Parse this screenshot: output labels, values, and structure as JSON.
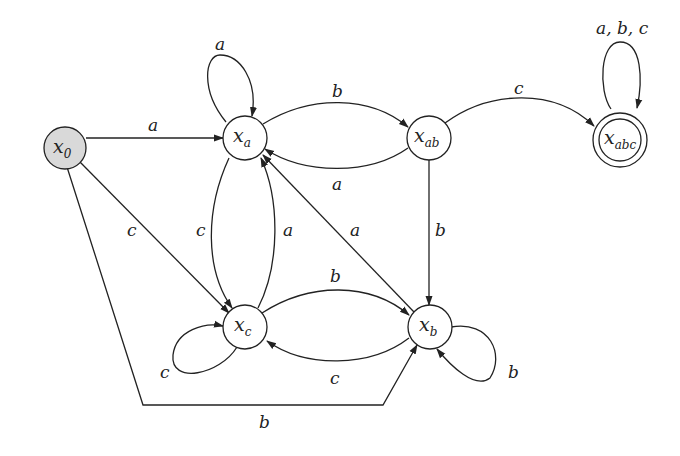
{
  "diagram": {
    "type": "finite-state-automaton",
    "states": [
      {
        "id": "x0",
        "label": "x",
        "sub": "0",
        "initial": true,
        "accepting": false
      },
      {
        "id": "xa",
        "label": "x",
        "sub": "a",
        "initial": false,
        "accepting": false
      },
      {
        "id": "xab",
        "label": "x",
        "sub": "ab",
        "initial": false,
        "accepting": false
      },
      {
        "id": "xabc",
        "label": "x",
        "sub": "abc",
        "initial": false,
        "accepting": true
      },
      {
        "id": "xc",
        "label": "x",
        "sub": "c",
        "initial": false,
        "accepting": false
      },
      {
        "id": "xb",
        "label": "x",
        "sub": "b",
        "initial": false,
        "accepting": false
      }
    ],
    "transitions": [
      {
        "from": "x0",
        "to": "xa",
        "label": "a"
      },
      {
        "from": "x0",
        "to": "xc",
        "label": "c"
      },
      {
        "from": "x0",
        "to": "xb",
        "label": "b"
      },
      {
        "from": "xa",
        "to": "xa",
        "label": "a"
      },
      {
        "from": "xa",
        "to": "xab",
        "label": "b"
      },
      {
        "from": "xa",
        "to": "xc",
        "label": "c"
      },
      {
        "from": "xab",
        "to": "xa",
        "label": "a"
      },
      {
        "from": "xab",
        "to": "xabc",
        "label": "c"
      },
      {
        "from": "xab",
        "to": "xb",
        "label": "b"
      },
      {
        "from": "xabc",
        "to": "xabc",
        "label": "a, b, c"
      },
      {
        "from": "xc",
        "to": "xa",
        "label": "a"
      },
      {
        "from": "xc",
        "to": "xc",
        "label": "c"
      },
      {
        "from": "xc",
        "to": "xb",
        "label": "b"
      },
      {
        "from": "xb",
        "to": "xa",
        "label": "a"
      },
      {
        "from": "xb",
        "to": "xc",
        "label": "c"
      },
      {
        "from": "xb",
        "to": "xb",
        "label": "b"
      }
    ]
  },
  "colors": {
    "stroke": "#222222",
    "initial_fill": "#d9d9d9",
    "background": "#ffffff"
  }
}
